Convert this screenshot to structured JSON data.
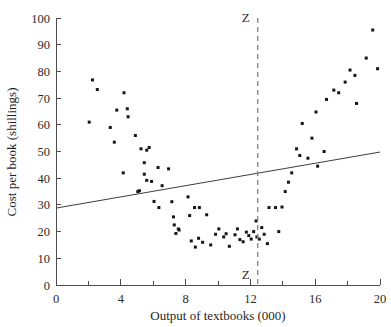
{
  "chart_data": {
    "type": "scatter",
    "title": "",
    "xlabel": "Output of textbooks (000)",
    "ylabel": "Cost per book (shillings)",
    "xlim": [
      0,
      20
    ],
    "ylim": [
      0,
      100
    ],
    "xticks": [
      0,
      4,
      8,
      12,
      16,
      20
    ],
    "xtick_labels": [
      "0",
      "4",
      "8",
      "12",
      "16",
      "20"
    ],
    "xminor_ticks": [
      2,
      6,
      10,
      14,
      18
    ],
    "yticks": [
      0,
      10,
      20,
      30,
      40,
      50,
      60,
      70,
      80,
      90,
      100
    ],
    "ytick_labels": [
      "0",
      "10",
      "20",
      "30",
      "40",
      "50",
      "60",
      "70",
      "80",
      "90",
      "100"
    ],
    "grid": false,
    "legend": null,
    "points": [
      [
        2.05,
        61.0
      ],
      [
        2.25,
        76.8
      ],
      [
        2.55,
        73.2
      ],
      [
        3.35,
        59.0
      ],
      [
        3.75,
        65.5
      ],
      [
        4.2,
        72.0
      ],
      [
        4.4,
        66.0
      ],
      [
        4.45,
        63.0
      ],
      [
        4.15,
        42.0
      ],
      [
        3.6,
        53.5
      ],
      [
        4.9,
        56.0
      ],
      [
        5.25,
        51.0
      ],
      [
        5.45,
        45.8
      ],
      [
        5.6,
        50.5
      ],
      [
        5.75,
        51.5
      ],
      [
        5.05,
        35.0
      ],
      [
        5.15,
        35.3
      ],
      [
        5.45,
        41.5
      ],
      [
        5.6,
        39.2
      ],
      [
        5.9,
        38.8
      ],
      [
        6.05,
        31.3
      ],
      [
        6.3,
        44.0
      ],
      [
        6.35,
        29.0
      ],
      [
        6.55,
        37.2
      ],
      [
        6.95,
        43.5
      ],
      [
        7.15,
        31.2
      ],
      [
        7.25,
        25.5
      ],
      [
        7.3,
        22.5
      ],
      [
        7.4,
        19.3
      ],
      [
        7.55,
        21.0
      ],
      [
        7.6,
        20.6
      ],
      [
        8.15,
        33.0
      ],
      [
        8.25,
        26.0
      ],
      [
        8.55,
        29.0
      ],
      [
        8.85,
        29.0
      ],
      [
        8.6,
        14.2
      ],
      [
        8.35,
        16.5
      ],
      [
        8.8,
        17.5
      ],
      [
        9.05,
        16.0
      ],
      [
        9.3,
        26.3
      ],
      [
        9.55,
        15.0
      ],
      [
        9.85,
        19.0
      ],
      [
        10.05,
        21.0
      ],
      [
        10.35,
        18.0
      ],
      [
        10.5,
        19.2
      ],
      [
        10.7,
        14.5
      ],
      [
        11.05,
        18.8
      ],
      [
        11.2,
        21.0
      ],
      [
        11.35,
        17.0
      ],
      [
        11.55,
        16.2
      ],
      [
        11.75,
        19.8
      ],
      [
        11.9,
        18.5
      ],
      [
        12.05,
        17.2
      ],
      [
        12.2,
        20.0
      ],
      [
        12.35,
        24.0
      ],
      [
        12.4,
        18.0
      ],
      [
        12.55,
        17.2
      ],
      [
        12.7,
        21.5
      ],
      [
        12.85,
        19.0
      ],
      [
        13.05,
        15.5
      ],
      [
        13.15,
        29.0
      ],
      [
        13.55,
        29.0
      ],
      [
        13.75,
        20.0
      ],
      [
        13.95,
        29.2
      ],
      [
        14.15,
        35.0
      ],
      [
        14.35,
        38.5
      ],
      [
        14.55,
        42.0
      ],
      [
        14.85,
        51.0
      ],
      [
        15.05,
        48.5
      ],
      [
        15.2,
        60.5
      ],
      [
        15.55,
        47.5
      ],
      [
        15.8,
        55.0
      ],
      [
        16.05,
        64.8
      ],
      [
        16.15,
        44.5
      ],
      [
        16.55,
        50.0
      ],
      [
        16.7,
        69.5
      ],
      [
        17.15,
        73.0
      ],
      [
        17.45,
        72.0
      ],
      [
        17.85,
        76.0
      ],
      [
        18.15,
        80.5
      ],
      [
        18.45,
        78.5
      ],
      [
        18.55,
        68.0
      ],
      [
        19.15,
        85.0
      ],
      [
        19.55,
        95.5
      ],
      [
        19.85,
        81.0
      ]
    ],
    "trend_line": {
      "name": "fitted cost line",
      "x_start": 0.0,
      "y_start": 28.8,
      "x_end": 20.0,
      "y_end": 49.8
    },
    "reference_line": {
      "name": "Z",
      "orientation": "vertical",
      "x": 12.45,
      "label_top": "Z",
      "label_bottom": "Z",
      "style": "dashed"
    },
    "colors": {
      "point": "#151515",
      "trend": "#3d3d3d",
      "reference": "#8a8a8a",
      "axis": "#4d4d4d",
      "background": "#ffffff"
    }
  }
}
